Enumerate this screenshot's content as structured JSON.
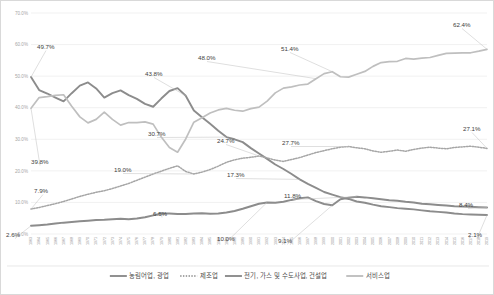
{
  "chart_data": {
    "type": "line",
    "title": "",
    "subtitle": "",
    "xlabel": "",
    "ylabel": "",
    "ylim": [
      0,
      70
    ],
    "yticks": [
      0,
      10,
      20,
      30,
      40,
      50,
      60,
      70
    ],
    "ytick_labels": [
      "0.0%",
      "10.0%",
      "20.0%",
      "30.0%",
      "40.0%",
      "50.0%",
      "60.0%",
      "70.0%"
    ],
    "grid": true,
    "legend_position": "bottom",
    "x": [
      1963,
      1964,
      1965,
      1966,
      1967,
      1968,
      1969,
      1970,
      1971,
      1972,
      1973,
      1974,
      1975,
      1976,
      1977,
      1978,
      1979,
      1980,
      1981,
      1982,
      1983,
      1984,
      1985,
      1986,
      1987,
      1988,
      1989,
      1990,
      1991,
      1992,
      1993,
      1994,
      1995,
      1996,
      1997,
      1998,
      1999,
      2000,
      2001,
      2002,
      2003,
      2004,
      2005,
      2006,
      2007,
      2008,
      2009,
      2010,
      2011,
      2012,
      2013,
      2014,
      2015,
      2016,
      2017,
      2018,
      2019
    ],
    "x_tick_labels": [
      "1963",
      "1964",
      "1965",
      "1966",
      "1967",
      "1968",
      "1969",
      "1970",
      "1971",
      "1972",
      "1973",
      "1974",
      "1975",
      "1976",
      "1977",
      "1978",
      "1979",
      "1980",
      "1981",
      "1982",
      "1983",
      "1984",
      "1985",
      "1986",
      "1987",
      "1988",
      "1989",
      "1990",
      "1991",
      "1992",
      "1993",
      "1994",
      "1995",
      "1996",
      "1997",
      "1998",
      "1999",
      "2000",
      "2001",
      "2002",
      "2003",
      "2004",
      "2005",
      "2006",
      "2007",
      "2008",
      "2009",
      "2010",
      "2011",
      "2012",
      "2013",
      "2014",
      "2015",
      "2016",
      "2017",
      "2018",
      "2019"
    ],
    "series": [
      {
        "name": "농림어업, 광업",
        "style": "solid",
        "color": "#8c8c8c",
        "width": 1.9,
        "values": [
          49.7,
          45.6,
          44.5,
          43.2,
          42.0,
          44.6,
          47.0,
          48.0,
          46.1,
          43.2,
          44.6,
          45.5,
          44.0,
          42.8,
          41.2,
          40.3,
          42.9,
          45.3,
          46.2,
          43.8,
          39.1,
          37.0,
          34.9,
          32.7,
          30.7,
          30.0,
          29.1,
          27.2,
          25.5,
          23.8,
          22.0,
          20.6,
          19.0,
          17.3,
          15.9,
          14.6,
          13.3,
          12.5,
          11.7,
          11.1,
          10.3,
          9.9,
          9.3,
          8.8,
          8.5,
          8.2,
          8.0,
          7.8,
          7.5,
          7.2,
          7.0,
          6.8,
          6.5,
          6.3,
          6.2,
          6.1,
          6.0
        ]
      },
      {
        "name": "제조업",
        "style": "dotted",
        "color": "#a6a6a6",
        "width": 1.5,
        "values": [
          7.9,
          8.4,
          9.0,
          9.6,
          10.3,
          11.1,
          11.9,
          12.6,
          13.2,
          13.7,
          14.4,
          15.2,
          16.0,
          17.0,
          18.0,
          19.0,
          19.9,
          20.8,
          21.6,
          19.8,
          19.0,
          19.6,
          20.4,
          21.5,
          22.7,
          23.5,
          24.0,
          24.3,
          24.7,
          24.1,
          23.4,
          23.0,
          23.6,
          24.2,
          25.0,
          25.8,
          26.4,
          27.0,
          27.5,
          27.7,
          27.3,
          27.0,
          26.3,
          25.9,
          26.2,
          26.6,
          26.2,
          26.8,
          27.2,
          27.5,
          27.2,
          27.0,
          27.4,
          27.6,
          27.8,
          27.5,
          27.1
        ]
      },
      {
        "name": "전기, 가스 및 수도사업, 건설업",
        "style": "solid",
        "color": "#8c8c8c",
        "width": 2.0,
        "values": [
          2.6,
          2.8,
          3.0,
          3.3,
          3.6,
          3.8,
          4.0,
          4.2,
          4.4,
          4.5,
          4.7,
          4.8,
          4.7,
          4.9,
          5.3,
          5.9,
          6.5,
          6.5,
          6.3,
          6.3,
          6.5,
          6.6,
          6.4,
          6.5,
          6.8,
          7.3,
          8.0,
          8.8,
          9.6,
          10.0,
          9.9,
          10.2,
          10.8,
          11.3,
          11.6,
          10.4,
          9.5,
          9.1,
          11.0,
          11.5,
          11.8,
          11.6,
          11.3,
          11.0,
          10.7,
          10.5,
          10.2,
          10.0,
          9.6,
          9.4,
          9.2,
          9.0,
          8.8,
          8.7,
          8.6,
          8.5,
          8.4
        ]
      },
      {
        "name": "서비스업",
        "style": "solid",
        "color": "#bfbfbf",
        "width": 1.7,
        "values": [
          39.8,
          43.2,
          43.5,
          43.9,
          44.1,
          40.5,
          37.1,
          35.2,
          36.3,
          38.6,
          36.3,
          34.5,
          35.3,
          35.3,
          35.5,
          34.8,
          30.7,
          27.4,
          25.9,
          30.1,
          35.4,
          36.8,
          38.3,
          39.3,
          39.8,
          39.2,
          38.9,
          39.7,
          40.2,
          42.1,
          44.7,
          46.2,
          46.6,
          47.2,
          47.5,
          49.2,
          50.8,
          51.4,
          49.8,
          49.7,
          50.6,
          51.5,
          53.1,
          54.3,
          54.6,
          54.7,
          55.6,
          55.4,
          55.7,
          55.9,
          56.6,
          57.2,
          57.3,
          57.4,
          57.4,
          57.9,
          58.5
        ]
      }
    ],
    "annotations": [
      {
        "text": "49.7%",
        "series": "농림어업, 광업",
        "x": 1963,
        "value": 49.7,
        "lx": 36,
        "ly": 48
      },
      {
        "text": "39.8%",
        "series": "서비스업",
        "x": 1963,
        "value": 39.8,
        "lx": 30,
        "ly": 163
      },
      {
        "text": "7.9%",
        "series": "제조업",
        "x": 1963,
        "value": 7.9,
        "lx": 33,
        "ly": 192
      },
      {
        "text": "2.6%",
        "series": "전기, 가스 및 수도사업, 건설업",
        "x": 1963,
        "value": 2.6,
        "lx": 5,
        "ly": 236
      },
      {
        "text": "43.8%",
        "series": "서비스업",
        "x": 1982,
        "value": 43.8,
        "lx": 144,
        "ly": 75
      },
      {
        "text": "48.0%",
        "series": "서비스업",
        "x": 1998,
        "value": 49.2,
        "lx": 197,
        "ly": 59
      },
      {
        "text": "51.4%",
        "series": "서비스업",
        "x": 2000,
        "value": 51.4,
        "lx": 280,
        "ly": 50
      },
      {
        "text": "62.4%",
        "series": "서비스업",
        "x": 2019,
        "value": 58.5,
        "lx": 452,
        "ly": 26
      },
      {
        "text": "30.7%",
        "series": "농림어업, 광업",
        "x": 1987,
        "value": 30.7,
        "lx": 147,
        "ly": 135
      },
      {
        "text": "19.0%",
        "series": "제조업",
        "x": 1983,
        "value": 19.0,
        "lx": 113,
        "ly": 171
      },
      {
        "text": "24.7%",
        "series": "제조업",
        "x": 1991,
        "value": 24.7,
        "lx": 216,
        "ly": 142
      },
      {
        "text": "17.3%",
        "series": "농림어업, 광업",
        "x": 1996,
        "value": 17.3,
        "lx": 226,
        "ly": 176
      },
      {
        "text": "27.7%",
        "series": "제조업",
        "x": 2002,
        "value": 27.7,
        "lx": 281,
        "ly": 144
      },
      {
        "text": "27.1%",
        "series": "제조업",
        "x": 2019,
        "value": 27.1,
        "lx": 462,
        "ly": 130
      },
      {
        "text": "6.5%",
        "series": "전기, 가스 및 수도사업, 건설업",
        "x": 1979,
        "value": 6.5,
        "lx": 152,
        "ly": 215
      },
      {
        "text": "10.0%",
        "series": "전기, 가스 및 수도사업, 건설업",
        "x": 1992,
        "value": 10.0,
        "lx": 216,
        "ly": 240
      },
      {
        "text": "9.1%",
        "series": "전기, 가스 및 수도사업, 건설업",
        "x": 2000,
        "value": 9.1,
        "lx": 277,
        "ly": 242
      },
      {
        "text": "11.8%",
        "series": "전기, 가스 및 수도사업, 건설업",
        "x": 2003,
        "value": 11.8,
        "lx": 283,
        "ly": 197
      },
      {
        "text": "8.4%",
        "series": "전기, 가스 및 수도사업, 건설업",
        "x": 2019,
        "value": 8.4,
        "lx": 458,
        "ly": 206
      },
      {
        "text": "2.1%",
        "series": "농림어업, 광업",
        "x": 2019,
        "value": 6.0,
        "lx": 467,
        "ly": 236
      }
    ]
  },
  "legend": {
    "items": [
      {
        "label": "농림어업, 광업",
        "style": "solid",
        "color": "#8c8c8c"
      },
      {
        "label": "제조업",
        "style": "dotted",
        "color": "#a6a6a6"
      },
      {
        "label": "전기, 가스 및 수도사업, 건설업",
        "style": "solid",
        "color": "#8c8c8c"
      },
      {
        "label": "서비스업",
        "style": "solid",
        "color": "#bfbfbf"
      }
    ]
  },
  "colors": {
    "grid": "#e8e8e8",
    "border": "#d9d9d9",
    "axis_text": "#a6a6a6",
    "label_text": "#404040"
  }
}
